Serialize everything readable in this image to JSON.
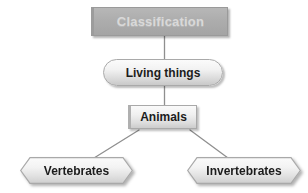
{
  "diagram": {
    "title": "Classification",
    "type": "hierarchy-tree",
    "background_color": "#ffffff",
    "nodes": [
      {
        "id": "classification",
        "label": "Classification",
        "shape": "rectangle",
        "level": 0,
        "fill_color": "#adadad",
        "text_color": "#d9d9d9",
        "border_color": "#9a9a9a"
      },
      {
        "id": "living-things",
        "label": "Living things",
        "shape": "rounded-rectangle",
        "level": 1,
        "fill_color": "#eeeeee",
        "text_color": "#1c1c1c",
        "border_color": "#a9a9a9"
      },
      {
        "id": "animals",
        "label": "Animals",
        "shape": "rectangle",
        "level": 2,
        "fill_color": "#eeeeee",
        "text_color": "#1c1c1c",
        "border_color": "#a9a9a9"
      },
      {
        "id": "vertebrates",
        "label": "Vertebrates",
        "shape": "hexagon",
        "level": 3,
        "fill_color": "#eeeeee",
        "text_color": "#1c1c1c",
        "border_color": "#a9a9a9"
      },
      {
        "id": "invertebrates",
        "label": "Invertebrates",
        "shape": "hexagon",
        "level": 3,
        "fill_color": "#eeeeee",
        "text_color": "#1c1c1c",
        "border_color": "#a9a9a9"
      }
    ],
    "edges": [
      {
        "from": "classification",
        "to": "living-things",
        "style": "vertical-line"
      },
      {
        "from": "living-things",
        "to": "animals",
        "style": "vertical-line"
      },
      {
        "from": "animals",
        "to": "vertebrates",
        "style": "diagonal-line"
      },
      {
        "from": "animals",
        "to": "invertebrates",
        "style": "diagonal-line"
      }
    ],
    "connector_color": "#8f8f8f"
  }
}
